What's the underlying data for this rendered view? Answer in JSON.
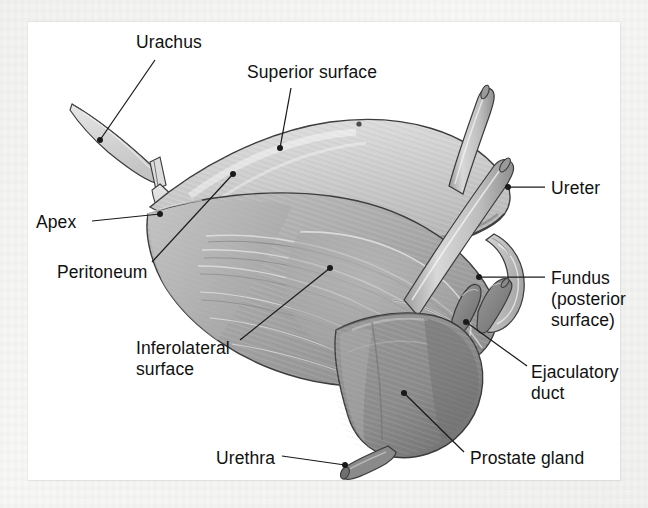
{
  "figure": {
    "panel_background": "#ffffff",
    "page_background": "#f3f3f1",
    "ink_color": "#111111"
  },
  "palette": {
    "superior_surface": "#cfcfcf",
    "peritoneum_fold": "#d8d8d8",
    "bladder_body": "#a9a9a9",
    "bladder_shadow": "#8f8f8f",
    "prostate": "#8d8d8d",
    "prostate_shadow": "#6f6f6f",
    "ureter_tube": "#c2c2c2",
    "seminal_vesicle": "#bcbcbc",
    "ejaculatory_duct": "#7e7e7e",
    "urethra": "#7a7a7a",
    "outline": "#3b3b3b",
    "leader_line": "#1a1a1a"
  },
  "labels": [
    {
      "id": "urachus",
      "text": "Urachus",
      "x": 136,
      "y": 32,
      "align": "left",
      "leader": {
        "from_x": 155,
        "from_y": 60,
        "to_x": 100,
        "to_y": 140
      },
      "dot": {
        "x": 100,
        "y": 140
      }
    },
    {
      "id": "superior-surface",
      "text": "Superior surface",
      "x": 247,
      "y": 62,
      "align": "left",
      "leader": {
        "from_x": 291,
        "from_y": 88,
        "to_x": 280,
        "to_y": 148
      },
      "dot": {
        "x": 280,
        "y": 148
      }
    },
    {
      "id": "ureter",
      "text": "Ureter",
      "x": 551,
      "y": 178,
      "align": "left",
      "leader": {
        "from_x": 545,
        "from_y": 187,
        "to_x": 508,
        "to_y": 187
      },
      "dot": {
        "x": 508,
        "y": 187
      }
    },
    {
      "id": "apex",
      "text": "Apex",
      "x": 36,
      "y": 212,
      "align": "left",
      "leader": {
        "from_x": 92,
        "from_y": 221,
        "to_x": 160,
        "to_y": 214
      },
      "dot": {
        "x": 160,
        "y": 214
      }
    },
    {
      "id": "peritoneum",
      "text": "Peritoneum",
      "x": 57,
      "y": 262,
      "align": "left",
      "leader": {
        "from_x": 152,
        "from_y": 262,
        "to_x": 233,
        "to_y": 174
      },
      "dot": {
        "x": 233,
        "y": 174
      }
    },
    {
      "id": "fundus",
      "text": "Fundus\n(posterior\nsurface)",
      "x": 551,
      "y": 268,
      "align": "left",
      "leader": {
        "from_x": 545,
        "from_y": 277,
        "to_x": 479,
        "to_y": 277
      },
      "dot": {
        "x": 479,
        "y": 277
      }
    },
    {
      "id": "inferolateral-surface",
      "text": "Inferolateral\nsurface",
      "x": 136,
      "y": 338,
      "align": "left",
      "leader": {
        "from_x": 240,
        "from_y": 340,
        "to_x": 330,
        "to_y": 268
      },
      "dot": {
        "x": 330,
        "y": 268
      }
    },
    {
      "id": "ejaculatory-duct",
      "text": "Ejaculatory\nduct",
      "x": 531,
      "y": 362,
      "align": "left",
      "leader": {
        "from_x": 527,
        "from_y": 366,
        "to_x": 466,
        "to_y": 322
      },
      "dot": {
        "x": 466,
        "y": 322
      }
    },
    {
      "id": "prostate-gland",
      "text": "Prostate gland",
      "x": 470,
      "y": 448,
      "align": "left",
      "leader": {
        "from_x": 464,
        "from_y": 452,
        "to_x": 404,
        "to_y": 393
      },
      "dot": {
        "x": 404,
        "y": 393
      }
    },
    {
      "id": "urethra",
      "text": "Urethra",
      "x": 216,
      "y": 448,
      "align": "left",
      "leader": {
        "from_x": 282,
        "from_y": 456,
        "to_x": 345,
        "to_y": 465
      },
      "dot": {
        "x": 345,
        "y": 465
      }
    }
  ],
  "structures": [
    {
      "id": "urachus-strip",
      "name": "urachus"
    },
    {
      "id": "peritoneum-sheet",
      "name": "peritoneum"
    },
    {
      "id": "bladder-superior",
      "name": "superior surface of bladder"
    },
    {
      "id": "bladder-body",
      "name": "inferolateral surface of bladder"
    },
    {
      "id": "ureter-left-tube",
      "name": "left ureter"
    },
    {
      "id": "ureter-right-tube",
      "name": "right ureter"
    },
    {
      "id": "seminal-vesicle",
      "name": "seminal vesicle / fundus region"
    },
    {
      "id": "ejaculatory-ducts",
      "name": "ejaculatory duct"
    },
    {
      "id": "prostate",
      "name": "prostate gland"
    },
    {
      "id": "urethra-stub",
      "name": "urethra"
    }
  ]
}
